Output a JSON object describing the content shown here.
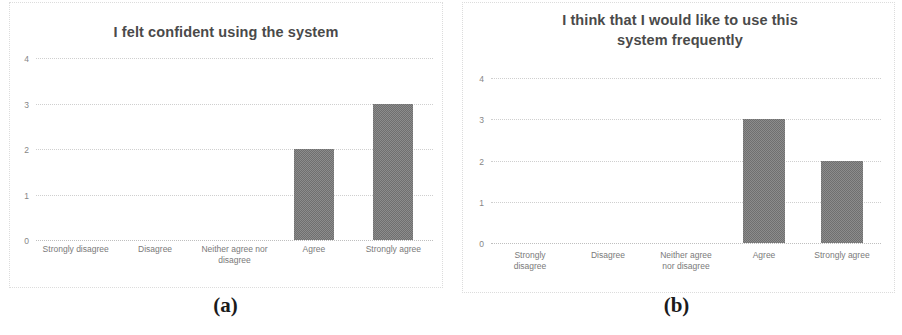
{
  "figure": {
    "panels": [
      {
        "caption": "(a)",
        "title_lines": [
          "I felt confident using the system"
        ],
        "chart_ref": 0
      },
      {
        "caption": "(b)",
        "title_lines": [
          "I think that I would like to use this",
          "system frequently"
        ],
        "chart_ref": 1
      }
    ]
  },
  "colors": {
    "bar_fill": "#6f6f6f",
    "bar_dither": "#8c8c8c",
    "gridline": "#cfcfcf",
    "title_text": "#4a4a4a",
    "tick_text": "#868686",
    "label_text": "#7a7a7a",
    "caption_text": "#1b1b1b",
    "background": "#ffffff"
  },
  "chart_data": [
    {
      "type": "bar",
      "title": "I felt confident using the system",
      "categories": [
        "Strongly disagree",
        "Disagree",
        "Neither agree nor disagree",
        "Agree",
        "Strongly agree"
      ],
      "category_lines": [
        [
          "Strongly disagree"
        ],
        [
          "Disagree"
        ],
        [
          "Neither agree nor",
          "disagree"
        ],
        [
          "Agree"
        ],
        [
          "Strongly agree"
        ]
      ],
      "values": [
        0,
        0,
        0,
        2,
        3
      ],
      "xlabel": "",
      "ylabel": "",
      "ylim": [
        0,
        4
      ],
      "yticks": [
        0,
        1,
        2,
        3,
        4
      ],
      "ytick_labels": [
        "0",
        "1",
        "2",
        "3",
        "4"
      ],
      "grid": true,
      "legend": false
    },
    {
      "type": "bar",
      "title": "I think that I would like to use this system frequently",
      "categories": [
        "Strongly disagree",
        "Disagree",
        "Neither agree nor disagree",
        "Agree",
        "Strongly agree"
      ],
      "category_lines": [
        [
          "Strongly",
          "disagree"
        ],
        [
          "Disagree"
        ],
        [
          "Neither agree",
          "nor disagree"
        ],
        [
          "Agree"
        ],
        [
          "Strongly agree"
        ]
      ],
      "values": [
        0,
        0,
        0,
        3,
        2
      ],
      "xlabel": "",
      "ylabel": "",
      "ylim": [
        0,
        4
      ],
      "yticks": [
        0,
        1,
        2,
        3,
        4
      ],
      "ytick_labels": [
        "0",
        "1",
        "2",
        "3",
        "4"
      ],
      "grid": true,
      "legend": false
    }
  ]
}
